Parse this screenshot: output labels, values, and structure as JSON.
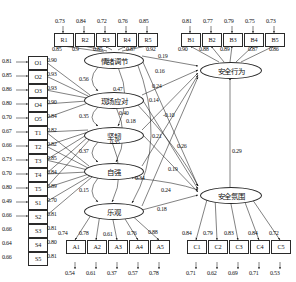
{
  "diagram": {
    "type": "sem-path-diagram",
    "latents": [
      {
        "id": "qxtj",
        "label": "情绪调节",
        "x": 84,
        "y": 52,
        "w": 58,
        "h": 15
      },
      {
        "id": "xcyd",
        "label": "现场应对",
        "x": 84,
        "y": 92,
        "w": 58,
        "h": 15
      },
      {
        "id": "jr",
        "label": "坚韧",
        "x": 84,
        "y": 127,
        "w": 58,
        "h": 15
      },
      {
        "id": "zq",
        "label": "自强",
        "x": 84,
        "y": 163,
        "w": 58,
        "h": 15
      },
      {
        "id": "lg",
        "label": "乐观",
        "x": 84,
        "y": 203,
        "w": 58,
        "h": 15
      },
      {
        "id": "aqxw",
        "label": "安全行为",
        "x": 200,
        "y": 62,
        "w": 60,
        "h": 15
      },
      {
        "id": "aqfw",
        "label": "安全氛围",
        "x": 200,
        "y": 187,
        "w": 60,
        "h": 15
      }
    ],
    "indicator_groups": [
      {
        "name": "R",
        "orientation": "top",
        "latent": "情绪调节",
        "items": [
          {
            "label": "R1",
            "error": "0.73",
            "loading": "0.85"
          },
          {
            "label": "R2",
            "error": "0.84",
            "loading": "0.9"
          },
          {
            "label": "R3",
            "error": "0.72",
            "loading": "0.85"
          },
          {
            "label": "R4",
            "error": "0.76",
            "loading": "0.87"
          },
          {
            "label": "R5",
            "error": "0.85",
            "loading": "0.92"
          }
        ]
      },
      {
        "name": "B",
        "orientation": "top",
        "latent": "安全行为",
        "items": [
          {
            "label": "B1",
            "error": "0.81",
            "loading": "0.90"
          },
          {
            "label": "B2",
            "error": "0.77",
            "loading": "0.88"
          },
          {
            "label": "B3",
            "error": "0.79",
            "loading": "0.89"
          },
          {
            "label": "B4",
            "error": "0.75",
            "loading": "0.87"
          },
          {
            "label": "B5",
            "error": "0.73",
            "loading": "0.86"
          }
        ]
      },
      {
        "name": "O",
        "orientation": "left",
        "latent": "现场应对",
        "items": [
          {
            "label": "O1",
            "error": "0.81",
            "loading": "0.90"
          },
          {
            "label": "O2",
            "error": "0.85",
            "loading": "0.93"
          },
          {
            "label": "O3",
            "error": "0.86",
            "loading": "0.93"
          },
          {
            "label": "O4",
            "error": "0.80",
            "loading": "0.90"
          },
          {
            "label": "O5",
            "error": "0.70",
            "loading": "0.84"
          }
        ]
      },
      {
        "name": "T",
        "orientation": "left",
        "latent": "坚韧",
        "items": [
          {
            "label": "T1",
            "error": "0.67",
            "loading": "0.82"
          },
          {
            "label": "T2",
            "error": "0.66",
            "loading": "0.82"
          },
          {
            "label": "T3",
            "error": "0.73",
            "loading": "0.85"
          },
          {
            "label": "T4",
            "error": "0.70",
            "loading": "0.84"
          },
          {
            "label": "T5",
            "error": "0.80",
            "loading": "0.89"
          }
        ]
      },
      {
        "name": "S",
        "orientation": "left",
        "latent": "自强",
        "items": [
          {
            "label": "S1",
            "error": "0.49",
            "loading": "0.70"
          },
          {
            "label": "S2",
            "error": "0.66",
            "loading": "0.81"
          },
          {
            "label": "S3",
            "error": "0.66",
            "loading": "0.81"
          },
          {
            "label": "S4",
            "error": "0.64",
            "loading": "0.80"
          },
          {
            "label": "S5",
            "error": "0.66",
            "loading": "0.81"
          }
        ]
      },
      {
        "name": "A",
        "orientation": "bottom",
        "latent": "乐观",
        "items": [
          {
            "label": "A1",
            "error": "0.54",
            "loading": "0.74"
          },
          {
            "label": "A2",
            "error": "0.61",
            "loading": "0.78"
          },
          {
            "label": "A3",
            "error": "0.37",
            "loading": "0.61"
          },
          {
            "label": "A4",
            "error": "0.57",
            "loading": "0.76"
          },
          {
            "label": "A5",
            "error": "0.78",
            "loading": "0.88"
          }
        ]
      },
      {
        "name": "C",
        "orientation": "bottom",
        "latent": "安全氛围",
        "items": [
          {
            "label": "C1",
            "error": "0.71",
            "loading": "0.84"
          },
          {
            "label": "C2",
            "error": "0.62",
            "loading": "0.79"
          },
          {
            "label": "C3",
            "error": "0.69",
            "loading": "0.83"
          },
          {
            "label": "C4",
            "error": "0.71",
            "loading": "0.84"
          },
          {
            "label": "C5",
            "error": "0.53",
            "loading": "0.72"
          }
        ]
      }
    ],
    "covariances": [
      {
        "from": "情绪调节",
        "to": "现场应对",
        "value": "0.56"
      },
      {
        "from": "情绪调节",
        "to": "坚韧",
        "value": "0.47"
      },
      {
        "from": "现场应对",
        "to": "坚韧",
        "value": "0.35"
      },
      {
        "from": "现场应对",
        "to": "自强",
        "value": "0.40"
      },
      {
        "from": "坚韧",
        "to": "自强",
        "value": "0.37"
      },
      {
        "from": "坚韧",
        "to": "乐观",
        "value": "0.35"
      },
      {
        "from": "自强",
        "to": "乐观",
        "value": "0.15"
      },
      {
        "from": "自强",
        "to": "安全氛围",
        "value": "0.34"
      },
      {
        "from": "现场应对",
        "to": "安全氛围",
        "value": "0.18"
      },
      {
        "from": "情绪调节",
        "to": "乐观",
        "value": "0.21"
      }
    ],
    "paths_to_behavior": [
      {
        "from": "情绪调节",
        "to": "安全行为",
        "value": "0.19"
      },
      {
        "from": "现场应对",
        "to": "安全行为",
        "value": "0.16"
      },
      {
        "from": "坚韧",
        "to": "安全行为",
        "value": "0.24"
      },
      {
        "from": "自强",
        "to": "安全行为",
        "value": "0.14"
      },
      {
        "from": "乐观",
        "to": "安全行为",
        "value": "-0.10"
      }
    ],
    "paths_to_climate": [
      {
        "from": "情绪调节",
        "to": "安全氛围",
        "value": "0.26"
      },
      {
        "from": "现场应对",
        "to": "安全氛围",
        "value": "0.19"
      },
      {
        "from": "坚韧",
        "to": "安全氛围",
        "value": "0.24"
      },
      {
        "from": "乐观",
        "to": "安全氛围",
        "value": "0.18"
      }
    ],
    "structural_path": {
      "from": "安全氛围",
      "to": "安全行为",
      "value": "0.29"
    }
  }
}
